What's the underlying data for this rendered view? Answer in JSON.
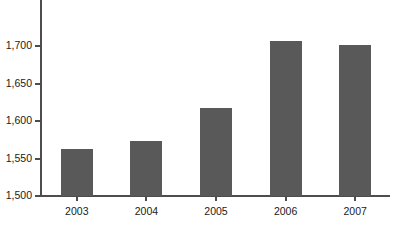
{
  "chart_data": {
    "type": "bar",
    "title": "",
    "xlabel": "",
    "ylabel": "",
    "categories": [
      "2003",
      "2004",
      "2005",
      "2006",
      "2007"
    ],
    "values": [
      1563,
      1574,
      1618,
      1707,
      1702
    ],
    "ylim": [
      1500,
      1725
    ],
    "yticks": [
      1500,
      1550,
      1600,
      1650,
      1700
    ],
    "ytick_labels": [
      "1,500",
      "1,550",
      "1,600",
      "1,650",
      "1,700"
    ],
    "grid": false,
    "legend": false,
    "bar_color": "#595959",
    "axis_color": "#4d4d4d",
    "background_color": "#ffffff"
  },
  "axis": {
    "y_labels": [
      "1,700",
      "1,650",
      "1,600",
      "1,550",
      "1,500"
    ],
    "x_labels": [
      "2003",
      "2004",
      "2005",
      "2006",
      "2007"
    ]
  },
  "bars": [
    {
      "category": "2003",
      "value": 1563
    },
    {
      "category": "2004",
      "value": 1574
    },
    {
      "category": "2005",
      "value": 1618
    },
    {
      "category": "2006",
      "value": 1707
    },
    {
      "category": "2007",
      "value": 1702
    }
  ]
}
